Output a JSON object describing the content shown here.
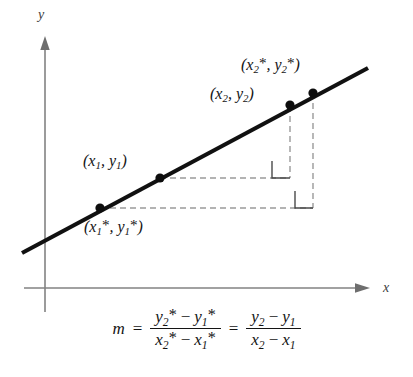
{
  "figure": {
    "background_color": "#ffffff"
  },
  "axes": {
    "x_label": "x",
    "y_label": "y",
    "color": "#808080",
    "origin": {
      "x": 45,
      "y": 288
    }
  },
  "line": {
    "color": "#111111",
    "description": "straight line with positive slope"
  },
  "points": [
    {
      "id": "p1star",
      "label_parts": {
        "open": "(",
        "var1": "x",
        "sub1": "1",
        "star1": "*",
        "comma": ", ",
        "var2": "y",
        "sub2": "1",
        "star2": "*",
        "close": ")"
      },
      "label_text": "(x1*, y1*)",
      "x": 100,
      "y": 208
    },
    {
      "id": "p1",
      "label_parts": {
        "open": "(",
        "var1": "x",
        "sub1": "1",
        "star1": "",
        "comma": ", ",
        "var2": "y",
        "sub2": "1",
        "star2": "",
        "close": ")"
      },
      "label_text": "(x1, y1)",
      "x": 160,
      "y": 178
    },
    {
      "id": "p2",
      "label_parts": {
        "open": "(",
        "var1": "x",
        "sub1": "2",
        "star1": "",
        "comma": ", ",
        "var2": "y",
        "sub2": "2",
        "star2": "",
        "close": ")"
      },
      "label_text": "(x2, y2)",
      "x": 290,
      "y": 105
    },
    {
      "id": "p2star",
      "label_parts": {
        "open": "(",
        "var1": "x",
        "sub1": "2",
        "star1": "*",
        "comma": ", ",
        "var2": "y",
        "sub2": "2",
        "star2": "*",
        "close": ")"
      },
      "label_text": "(x2*, y2*)",
      "x": 313,
      "y": 92
    }
  ],
  "construction": {
    "dash_color": "#9a9a9a",
    "right_angle_marker_count": 2
  },
  "formula": {
    "lhs": "m",
    "equals": "=",
    "fraction_1": {
      "numerator": {
        "v1": "y",
        "s1": "2",
        "star1": "*",
        "op": "−",
        "v2": "y",
        "s2": "1",
        "star2": "*"
      },
      "denominator": {
        "v1": "x",
        "s1": "2",
        "star1": "*",
        "op": "−",
        "v2": "x",
        "s2": "1",
        "star2": "*"
      }
    },
    "equals_2": "=",
    "fraction_2": {
      "numerator": {
        "v1": "y",
        "s1": "2",
        "star1": "",
        "op": "−",
        "v2": "y",
        "s2": "1",
        "star2": ""
      },
      "denominator": {
        "v1": "x",
        "s1": "2",
        "star1": "",
        "op": "−",
        "v2": "x",
        "s2": "1",
        "star2": ""
      }
    },
    "plain_text": "m = (y2* - y1*)/(x2* - x1*) = (y2 - y1)/(x2 - x1)"
  }
}
